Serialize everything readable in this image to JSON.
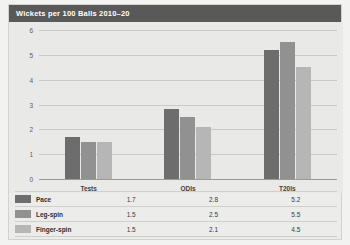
{
  "chart_data": {
    "type": "bar",
    "title": "Wickets per 100 Balls 2010–20",
    "xlabel": "",
    "ylabel": "",
    "ylim": [
      0,
      6
    ],
    "yticks": [
      "0",
      "1",
      "2",
      "3",
      "4",
      "5",
      "6"
    ],
    "grid": true,
    "legend_position": "bottom-table",
    "categories": [
      "Tests",
      "ODIs",
      "T20Is"
    ],
    "series": [
      {
        "name": "Pace",
        "color": "#6d6d6d",
        "values": [
          1.7,
          2.8,
          5.2
        ],
        "labels": [
          "1.7",
          "2.8",
          "5.2"
        ]
      },
      {
        "name": "Leg-spin",
        "color": "#919191",
        "values": [
          1.5,
          2.5,
          5.5
        ],
        "labels": [
          "1.5",
          "2.5",
          "5.5"
        ]
      },
      {
        "name": "Finger-spin",
        "color": "#b6b6b6",
        "values": [
          1.5,
          2.1,
          4.5
        ],
        "labels": [
          "1.5",
          "2.1",
          "4.5"
        ]
      }
    ]
  }
}
